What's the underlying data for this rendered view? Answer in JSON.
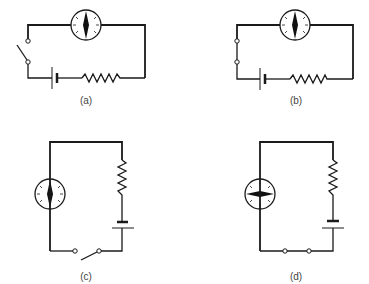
{
  "figure": {
    "panels": [
      {
        "id": "a",
        "label": "(a)",
        "switch_state": "open",
        "compass_needle": "vertical",
        "layout": "horizontal"
      },
      {
        "id": "b",
        "label": "(b)",
        "switch_state": "closed",
        "compass_needle": "vertical",
        "layout": "horizontal"
      },
      {
        "id": "c",
        "label": "(c)",
        "switch_state": "open",
        "compass_needle": "vertical",
        "layout": "vertical"
      },
      {
        "id": "d",
        "label": "(d)",
        "switch_state": "closed",
        "compass_needle": "horizontal",
        "layout": "vertical"
      }
    ],
    "components": [
      "compass",
      "switch",
      "battery",
      "resistor",
      "wire"
    ],
    "colors": {
      "ink": "#1a1a1a",
      "background": "#ffffff",
      "label": "#444444"
    }
  }
}
